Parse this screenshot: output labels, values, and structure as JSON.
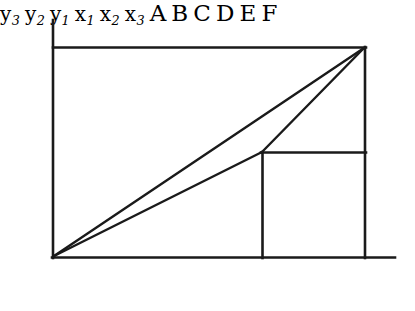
{
  "figure": {
    "kind": "geometry-diagram",
    "stroke_color": "#1a1a1a",
    "background_color": "#ffffff"
  },
  "axis_labels": {
    "y3": {
      "text": "y",
      "sub": "3"
    },
    "y2": {
      "text": "y",
      "sub": "2"
    },
    "y1": {
      "text": "y",
      "sub": "1"
    },
    "x1": {
      "text": "x",
      "sub": "1"
    },
    "x2": {
      "text": "x",
      "sub": "2"
    },
    "x3": {
      "text": "x",
      "sub": "3"
    }
  },
  "point_labels": {
    "A": "A",
    "B": "B",
    "C": "C",
    "D": "D",
    "E": "E",
    "F": "F"
  },
  "geometry": {
    "x1": 53,
    "x2": 262,
    "x3": 365,
    "y1": 257,
    "y2": 152,
    "y3": 47,
    "axis_top": 20,
    "axis_right": 395,
    "points": {
      "A": [
        53,
        257
      ],
      "B": [
        262,
        152
      ],
      "C": [
        365,
        47
      ],
      "D": [
        365,
        257
      ],
      "E": [
        262,
        257
      ],
      "F": [
        365,
        152
      ]
    },
    "segments": [
      "y-axis vertical from (53,20) to (53,257)",
      "x-axis horizontal from (53,257) to (395,257)",
      "top horizontal y3 from (53,47) to (365,47)",
      "right vertical x3 from (365,47) to (365,257)",
      "y2 horizontal from (262,152) to (365,152)",
      "x2 vertical from (262,152) to (262,257)",
      "diagonal A to C from (53,257) to (365,47)",
      "diagonal A to B from (53,257) to (262,152)",
      "diagonal B to C from (262,152) to (365,47)"
    ]
  }
}
